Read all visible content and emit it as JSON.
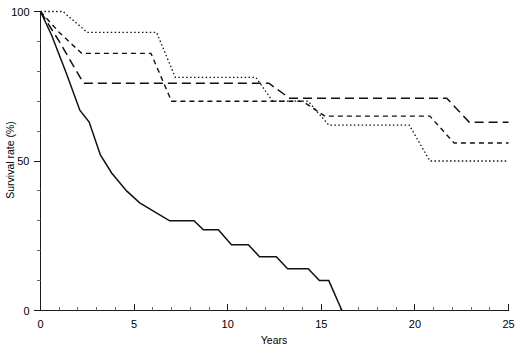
{
  "chart_data": {
    "type": "line",
    "title": "",
    "xlabel": "Years",
    "ylabel": "Survival rate (%)",
    "xlim": [
      0,
      25
    ],
    "ylim": [
      0,
      100
    ],
    "grid": false,
    "legend": "none",
    "x_ticks": [
      0,
      5,
      10,
      15,
      20,
      25
    ],
    "x_tick_labels": [
      "0",
      "5",
      "10",
      "15",
      "20",
      "25"
    ],
    "x_minor_step": 1,
    "y_ticks": [
      0,
      50,
      100
    ],
    "y_tick_labels": [
      "0",
      "50",
      "100"
    ],
    "y_minor_step": 10,
    "series": [
      {
        "name": "curve-dotted",
        "style": "dotted",
        "points": [
          [
            0.0,
            100
          ],
          [
            1.2,
            100
          ],
          [
            2.5,
            93
          ],
          [
            6.2,
            93
          ],
          [
            7.2,
            78
          ],
          [
            11.5,
            78
          ],
          [
            12.4,
            70
          ],
          [
            14.3,
            70
          ],
          [
            15.4,
            62
          ],
          [
            19.7,
            62
          ],
          [
            20.8,
            50
          ],
          [
            25.0,
            50
          ]
        ]
      },
      {
        "name": "curve-shortdash",
        "style": "short-dash",
        "points": [
          [
            0.0,
            100
          ],
          [
            1.0,
            93
          ],
          [
            2.2,
            86
          ],
          [
            5.9,
            86
          ],
          [
            7.0,
            70
          ],
          [
            14.0,
            70
          ],
          [
            15.2,
            65
          ],
          [
            20.8,
            65
          ],
          [
            22.1,
            56
          ],
          [
            25.0,
            56
          ]
        ]
      },
      {
        "name": "curve-longdash",
        "style": "long-dash",
        "points": [
          [
            0.0,
            100
          ],
          [
            1.0,
            90
          ],
          [
            2.3,
            76
          ],
          [
            12.2,
            76
          ],
          [
            13.3,
            71
          ],
          [
            21.7,
            71
          ],
          [
            22.9,
            63
          ],
          [
            25.0,
            63
          ]
        ]
      },
      {
        "name": "curve-solid",
        "style": "solid",
        "points": [
          [
            0.0,
            100
          ],
          [
            0.6,
            92
          ],
          [
            1.4,
            79
          ],
          [
            2.1,
            67
          ],
          [
            2.6,
            63
          ],
          [
            3.2,
            52
          ],
          [
            3.8,
            46
          ],
          [
            4.6,
            40
          ],
          [
            5.3,
            36
          ],
          [
            6.1,
            33
          ],
          [
            6.9,
            30
          ],
          [
            8.2,
            30
          ],
          [
            8.7,
            27
          ],
          [
            9.5,
            27
          ],
          [
            10.2,
            22
          ],
          [
            11.1,
            22
          ],
          [
            11.7,
            18
          ],
          [
            12.6,
            18
          ],
          [
            13.2,
            14
          ],
          [
            14.3,
            14
          ],
          [
            14.9,
            10
          ],
          [
            15.4,
            10
          ],
          [
            16.1,
            0
          ]
        ]
      }
    ]
  }
}
